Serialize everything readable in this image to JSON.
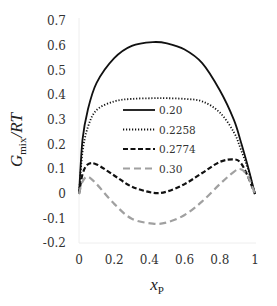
{
  "chart_data": {
    "type": "line",
    "title": "",
    "xlabel": "x_P",
    "ylabel": "G_mix/RT",
    "xlim": [
      0,
      1
    ],
    "ylim": [
      -0.2,
      0.7
    ],
    "xticks": [
      "0",
      "0.2",
      "0.4",
      "0.6",
      "0.8",
      "1"
    ],
    "yticks": [
      "0.7",
      "0.6",
      "0.5",
      "0.4",
      "0.3",
      "0.2",
      "0.1",
      "0",
      "-0.1",
      "-0.2"
    ],
    "grid": false,
    "legend_position": "center (inside plot)",
    "x": [
      0,
      0.02,
      0.05,
      0.1,
      0.2,
      0.3,
      0.42,
      0.5,
      0.6,
      0.7,
      0.8,
      0.88,
      0.92,
      0.96,
      1.0
    ],
    "series": [
      {
        "name": "0.20",
        "style": "solid",
        "color": "#111111",
        "values": [
          0,
          0.22,
          0.34,
          0.45,
          0.55,
          0.6,
          0.615,
          0.61,
          0.585,
          0.53,
          0.42,
          0.3,
          0.21,
          0.11,
          0
        ]
      },
      {
        "name": "0.2258",
        "style": "dotted",
        "color": "#111111",
        "values": [
          0,
          0.17,
          0.27,
          0.34,
          0.375,
          0.385,
          0.388,
          0.388,
          0.385,
          0.375,
          0.33,
          0.25,
          0.18,
          0.1,
          0
        ]
      },
      {
        "name": "0.2774",
        "style": "dashed",
        "color": "#111111",
        "values": [
          0,
          0.08,
          0.12,
          0.12,
          0.075,
          0.03,
          0.005,
          0.01,
          0.04,
          0.085,
          0.13,
          0.14,
          0.125,
          0.07,
          0
        ]
      },
      {
        "name": "0.30",
        "style": "long-dashed",
        "color": "#a0a0a0",
        "values": [
          0,
          0.05,
          0.07,
          0.04,
          -0.04,
          -0.1,
          -0.12,
          -0.115,
          -0.085,
          -0.03,
          0.04,
          0.09,
          0.1,
          0.07,
          0
        ]
      }
    ]
  },
  "axes": {
    "xlabel_main": "x",
    "xlabel_sub": "P",
    "ylabel_main": "G",
    "ylabel_sub": "mix",
    "ylabel_tail": "/RT"
  }
}
